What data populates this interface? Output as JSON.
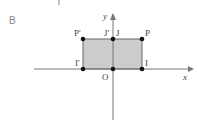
{
  "section_label": "B",
  "axes": {
    "x_label": "x",
    "y_label": "y",
    "origin_label": "O"
  },
  "points": {
    "P": "P",
    "P_prime": "P'",
    "J": "J",
    "J_prime": "J'",
    "I": "I",
    "I_prime": "I'"
  },
  "colors": {
    "fill": "#cccccc",
    "stroke": "#555555",
    "axis": "#777777",
    "point": "#111111"
  }
}
